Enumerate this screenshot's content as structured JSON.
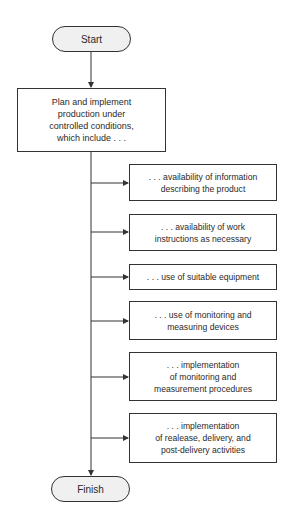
{
  "flowchart": {
    "start": "Start",
    "main": "Plan and implement\nproduction under\ncontrolled conditions,\nwhich include . . .",
    "items": [
      ". . . availability of information\ndescribing the product",
      ". . . availability of work\ninstructions as necessary",
      ". . . use of suitable equipment",
      ". . . use of monitoring and\nmeasuring devices",
      ". . . implementation\nof monitoring and\nmeasurement procedures",
      ". . . implementation\nof realease, delivery, and\npost-delivery activities"
    ],
    "finish": "Finish"
  }
}
